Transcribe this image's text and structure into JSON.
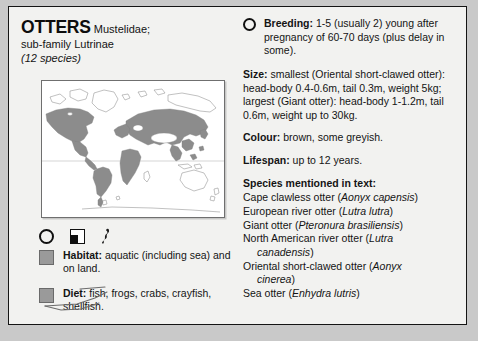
{
  "heading": {
    "title": "OTTERS",
    "family": " Mustelidae;",
    "subfamily": "sub-family Lutrinae",
    "species_count": "(12 species)"
  },
  "map": {
    "name": "world-distribution-map",
    "range_color": "#8c8c8c",
    "outline_color": "#8a8a8a",
    "background": "#ffffff"
  },
  "icons": {
    "breeding_icon": "circle-outline-icon",
    "habitat_icon": "half-filled-square-icon",
    "otter_icon": "otter-silhouette-icon"
  },
  "legend": [
    {
      "swatch_color": "#9a9a9a",
      "label": "Habitat:",
      "text": " aquatic (including sea) and on land."
    },
    {
      "swatch_color": "#9a9a9a",
      "label": "Diet:",
      "text": " fish, frogs, crabs, crayfish, shellfish."
    }
  ],
  "right": {
    "breeding": {
      "label": "Breeding:",
      "text": " 1-5 (usually 2) young after pregnancy of 60-70 days (plus delay in some)."
    },
    "size": {
      "label": "Size:",
      "text": " smallest (Oriental short-clawed otter): head-body 0.4-0.6m, tail 0.3m, weight 5kg; largest (Giant otter): head-body 1-1.2m, tail 0.6m, weight up to 30kg."
    },
    "colour": {
      "label": "Colour:",
      "text": " brown, some greyish."
    },
    "lifespan": {
      "label": "Lifespan:",
      "text": " up to 12 years."
    },
    "species_heading": "Species mentioned in text:",
    "species": [
      {
        "common": "Cape clawless otter (",
        "latin": "Aonyx capensis",
        "close": ")"
      },
      {
        "common": "European river otter (",
        "latin": "Lutra lutra",
        "close": ")"
      },
      {
        "common": "Giant otter (",
        "latin": "Pteronura brasiliensis",
        "close": ")"
      },
      {
        "common": "North American river otter (",
        "latin": "Lutra",
        "close": "",
        "cont_latin": "canadensis",
        "cont_close": ")"
      },
      {
        "common": "Oriental short-clawed otter (",
        "latin": "Aonyx",
        "close": "",
        "cont_latin": "cinerea",
        "cont_close": ")"
      },
      {
        "common": "Sea otter (",
        "latin": "Enhydra lutris",
        "close": ")"
      }
    ]
  },
  "annotations": {
    "strikethrough_word": "frogs",
    "underline_word": "shellfish",
    "pen_color": "#6c6c6c"
  }
}
